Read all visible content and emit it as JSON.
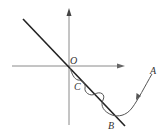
{
  "diagram": {
    "type": "trajectory-on-coordinate-axes",
    "labels": {
      "origin": "O",
      "point_a": "A",
      "point_b": "B",
      "point_c": "C"
    },
    "elements": [
      "x-axis (arrow right)",
      "y-axis (arrow up)",
      "straight line through O sloping down-right to B",
      "curve from A down to B, then oscillating about the line back to O",
      "direction arrow on curve near A"
    ],
    "colors": {
      "axis": "#8a8a8a",
      "line": "#222222",
      "curve": "#555555",
      "text": "#333333"
    }
  }
}
